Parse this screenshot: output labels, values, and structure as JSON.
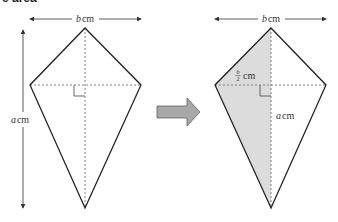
{
  "heading_fragment": "e area",
  "left_kite": {
    "width_label_var": "b",
    "width_label_unit": "cm",
    "height_label_var": "a",
    "height_label_unit": "cm"
  },
  "transform_arrow": {
    "icon": "right-arrow-icon",
    "color": "#a8a8a8"
  },
  "right_kite": {
    "width_label_var": "b",
    "width_label_unit": "cm",
    "half_width_num": "b",
    "half_width_den": "2",
    "half_width_unit": "cm",
    "height_label_var": "a",
    "height_label_unit": "cm",
    "shade_color": "#dcdcdc"
  },
  "colors": {
    "line": "#222222",
    "dash": "#666666",
    "arrow_fill": "#a8a8a8",
    "arrow_stroke": "#555555"
  }
}
